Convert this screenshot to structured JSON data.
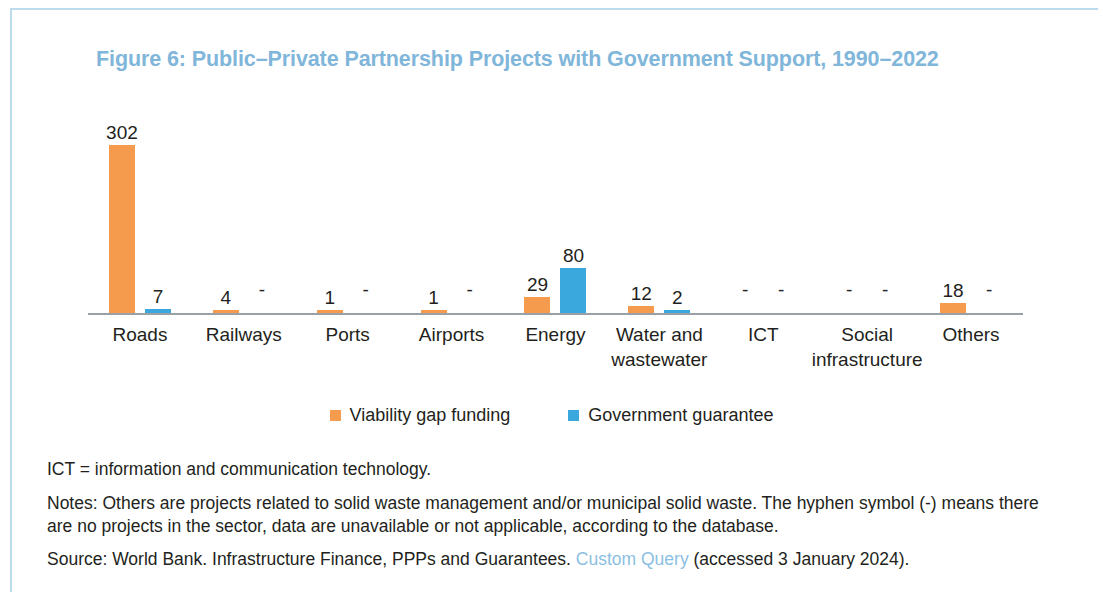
{
  "figure": {
    "title": "Figure 6: Public–Private Partnership Projects with Government Support, 1990–2022"
  },
  "chart_data": {
    "type": "bar",
    "title": "Figure 6: Public–Private Partnership Projects with Government Support, 1990–2022",
    "xlabel": "",
    "ylabel": "",
    "grid": false,
    "legend_position": "bottom",
    "ylim": [
      0,
      302
    ],
    "categories": [
      "Roads",
      "Railways",
      "Ports",
      "Airports",
      "Energy",
      "Water and wastewater",
      "ICT",
      "Social infrastructure",
      "Others"
    ],
    "series": [
      {
        "name": "Viability gap funding",
        "color": "#f59b4e",
        "values": [
          302,
          4,
          1,
          1,
          29,
          12,
          null,
          null,
          18
        ],
        "labels": [
          "302",
          "4",
          "1",
          "1",
          "29",
          "12",
          "-",
          "-",
          "18"
        ]
      },
      {
        "name": "Government guarantee",
        "color": "#3aa8dd",
        "values": [
          7,
          null,
          null,
          null,
          80,
          2,
          null,
          null,
          null
        ],
        "labels": [
          "7",
          "-",
          "-",
          "-",
          "80",
          "2",
          "-",
          "-",
          "-"
        ]
      }
    ]
  },
  "legend": [
    {
      "label": "Viability gap funding",
      "color": "#f59b4e",
      "key": "vgf"
    },
    {
      "label": "Government guarantee",
      "color": "#3aa8dd",
      "key": "gg"
    }
  ],
  "notes": {
    "abbreviation": "ICT = information and communication technology.",
    "note": "Notes: Others are projects related to solid waste management and/or municipal solid waste. The hyphen symbol (-) means there are no projects in the sector, data are unavailable or not applicable, according to the database.",
    "source_prefix": "Source: World Bank. Infrastructure Finance, PPPs and Guarantees. ",
    "source_link": "Custom Query",
    "source_suffix": " (accessed 3 January 2024)."
  },
  "colors": {
    "viability_gap_funding": "#f59b4e",
    "government_guarantee": "#3aa8dd",
    "title": "#7fb6da",
    "frame": "#bcdcec",
    "link": "#8cc0e2"
  }
}
